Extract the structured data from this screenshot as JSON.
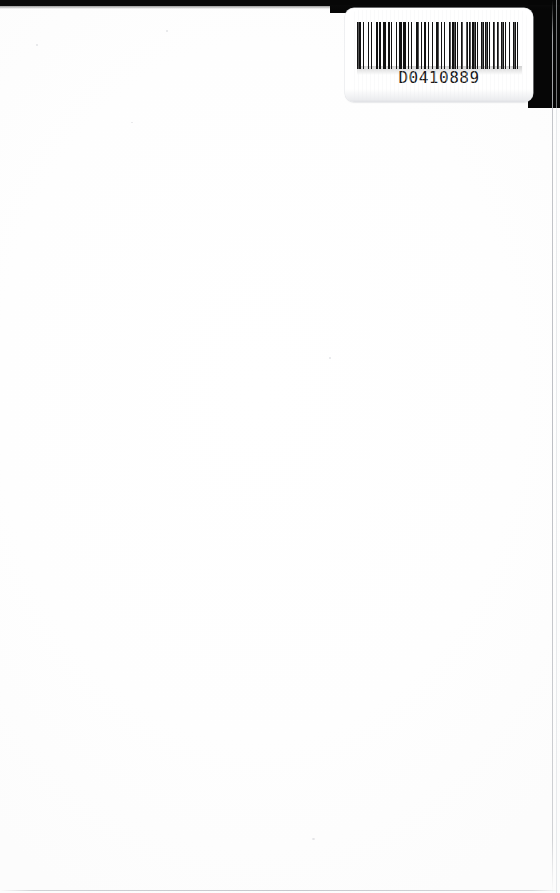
{
  "page": {
    "kind": "scanned-blank-page",
    "background_color": "#ffffff",
    "width": 560,
    "height": 893,
    "body_text": ""
  },
  "scan_edge": {
    "label": "scanner-bed-black-edge",
    "color": "#0a0a0a"
  },
  "barcode_label": {
    "name": "barcode-label",
    "number": "D0410889",
    "background_color": "#ffffff",
    "bar_color": "#111111",
    "symbology": "Code 39",
    "bar_widths": [
      3,
      2,
      1,
      3,
      1,
      2,
      1,
      3,
      2,
      1,
      1,
      2,
      3,
      1,
      2,
      1,
      1,
      3,
      1,
      2,
      2,
      1,
      3,
      1,
      1,
      2,
      1,
      3,
      3,
      1,
      1,
      2,
      2,
      1,
      1,
      3,
      1,
      2,
      3,
      1,
      1,
      2,
      1,
      3,
      2,
      1,
      3,
      1,
      1,
      2,
      2,
      3,
      1,
      1,
      2,
      1,
      3,
      1,
      1,
      2,
      3,
      1,
      2,
      1,
      1,
      3,
      1,
      2,
      2,
      1,
      3,
      1,
      1,
      2,
      1,
      3,
      2,
      1,
      1,
      3
    ]
  }
}
